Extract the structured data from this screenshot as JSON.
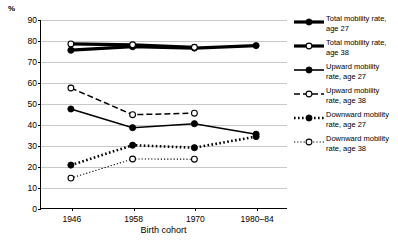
{
  "chart_data": {
    "type": "line",
    "title": "",
    "xlabel": "Birth cohort",
    "ylabel": "%",
    "categories": [
      "1946",
      "1958",
      "1970",
      "1980–84"
    ],
    "ylim": [
      0,
      90
    ],
    "y_ticks": [
      0,
      10,
      20,
      30,
      40,
      50,
      60,
      70,
      80,
      90
    ],
    "grid": true,
    "legend_position": "right",
    "series": [
      {
        "name": "Total mobility rate, age 27",
        "marker": "filled-circle",
        "line": "solid-thick",
        "values": [
          75.6,
          77.3,
          76.6,
          77.8
        ]
      },
      {
        "name": "Total mobility rate, age 38",
        "marker": "open-circle",
        "line": "solid-thick",
        "values": [
          78.6,
          78.2,
          77.0,
          null
        ]
      },
      {
        "name": "Upward mobility rate, age 27",
        "marker": "filled-circle",
        "line": "solid",
        "values": [
          47.6,
          38.7,
          40.6,
          35.6
        ]
      },
      {
        "name": "Upward mobility rate, age 38",
        "marker": "open-circle",
        "line": "dashed",
        "values": [
          57.6,
          44.9,
          45.6,
          null
        ]
      },
      {
        "name": "Downward mobility rate, age 27",
        "marker": "filled-circle",
        "line": "dotted-thick",
        "values": [
          20.9,
          30.4,
          29.2,
          34.5
        ]
      },
      {
        "name": "Downward mobility rate, age 38",
        "marker": "open-circle",
        "line": "dotted",
        "values": [
          14.7,
          23.8,
          23.7,
          null
        ]
      }
    ]
  },
  "axis": {
    "y_unit": "%",
    "x_title": "Birth cohort"
  },
  "legend": {
    "items": [
      {
        "label": "Total mobility rate,\nage 27"
      },
      {
        "label": "Total mobility rate,\nage 38"
      },
      {
        "label": "Upward mobility\nrate, age 27"
      },
      {
        "label": "Upward mobility\nrate, age 38"
      },
      {
        "label": "Downward mobility\nrate, age 27"
      },
      {
        "label": "Downward mobility\nrate, age 38"
      }
    ]
  },
  "colors": {
    "ink": "#000000",
    "gridline": "#c8c8c8",
    "background": "#ffffff"
  }
}
